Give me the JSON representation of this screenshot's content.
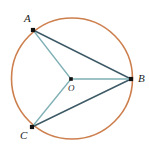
{
  "figure": {
    "kind": "circle-geometry-diagram",
    "width": 149,
    "height": 148,
    "background_color": "#ffffff"
  },
  "colors": {
    "circle_stroke": "#cd7f4e",
    "chord_dark": "#3d5a66",
    "radius_teal": "#7fb0b5",
    "point_fill": "#111111",
    "label_text": "#1b1b1b"
  },
  "circle": {
    "name": "circle-O",
    "cx": 72,
    "cy": 78.5,
    "r": 60.5,
    "stroke_width": 1.6
  },
  "points": [
    {
      "id": "A",
      "label": "A",
      "x": 33,
      "y": 30,
      "label_x": 24,
      "label_y": 13,
      "size": 4.2
    },
    {
      "id": "B",
      "label": "B",
      "x": 131,
      "y": 79,
      "label_x": 138,
      "label_y": 73,
      "size": 4.2
    },
    {
      "id": "C",
      "label": "C",
      "x": 32,
      "y": 127,
      "label_x": 20,
      "label_y": 130,
      "size": 4.2
    },
    {
      "id": "O",
      "label": "O",
      "x": 71,
      "y": 79,
      "label_x": 68,
      "label_y": 84,
      "size": 3.6
    }
  ],
  "segments": [
    {
      "id": "AB",
      "from": "A",
      "to": "B",
      "x1": 33,
      "y1": 30,
      "x2": 131,
      "y2": 79,
      "color_key": "chord_dark",
      "width": 1.4,
      "role": "chord"
    },
    {
      "id": "CB",
      "from": "C",
      "to": "B",
      "x1": 32,
      "y1": 127,
      "x2": 131,
      "y2": 79,
      "color_key": "chord_dark",
      "width": 1.4,
      "role": "chord"
    },
    {
      "id": "AO",
      "from": "A",
      "to": "O",
      "x1": 33,
      "y1": 30,
      "x2": 71,
      "y2": 79,
      "color_key": "radius_teal",
      "width": 1.3,
      "role": "radius"
    },
    {
      "id": "OB",
      "from": "O",
      "to": "B",
      "x1": 71,
      "y1": 79,
      "x2": 131,
      "y2": 79,
      "color_key": "radius_teal",
      "width": 1.3,
      "role": "radius"
    },
    {
      "id": "OC",
      "from": "O",
      "to": "C",
      "x1": 71,
      "y1": 79,
      "x2": 32,
      "y2": 127,
      "color_key": "radius_teal",
      "width": 1.3,
      "role": "radius"
    }
  ]
}
